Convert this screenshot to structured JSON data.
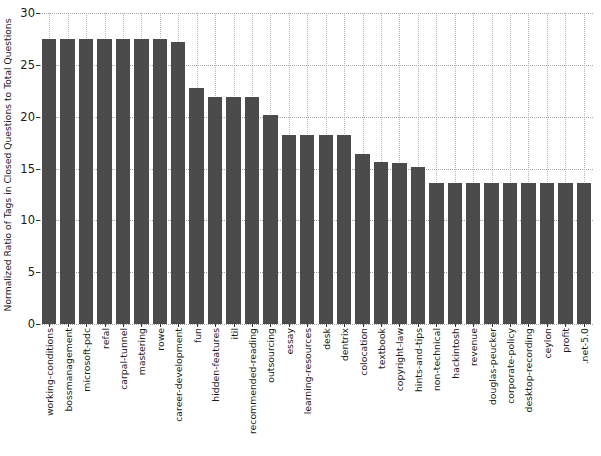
{
  "chart_data": {
    "type": "bar",
    "title": "",
    "xlabel": "",
    "ylabel": "Normalized Ratio of Tags in Closed Questions to Total Questions",
    "ylim": [
      0,
      30
    ],
    "yticks": [
      0,
      5,
      10,
      15,
      20,
      25,
      30
    ],
    "ytick_labels": [
      "0",
      "5",
      "10",
      "15",
      "20",
      "25",
      "30"
    ],
    "grid": true,
    "grid_style": "dotted",
    "legend": null,
    "bar_color": "#4b4b4b",
    "categories": [
      "working-conditions",
      "bossmanagement",
      "microsoft-pdc",
      "refal",
      "carpal-tunnel",
      "mastering",
      "rowe",
      "career-development",
      "fun",
      "hidden-features",
      "itil",
      "recommended-reading",
      "outsourcing",
      "essay",
      "learning-resources",
      "desk",
      "dentrix",
      "colocation",
      "textbook",
      "copyright-law",
      "hints-and-tips",
      "non-technical",
      "hackintosh",
      "revenue",
      "douglas-peucker",
      "corporate-policy",
      "desktop-recording",
      "ceylon",
      "profit",
      ".net-5.0"
    ],
    "values": [
      27.5,
      27.5,
      27.5,
      27.5,
      27.5,
      27.5,
      27.5,
      27.2,
      22.8,
      21.9,
      21.9,
      21.9,
      20.2,
      18.2,
      18.2,
      18.2,
      18.2,
      16.4,
      15.6,
      15.5,
      15.1,
      13.6,
      13.6,
      13.6,
      13.6,
      13.6,
      13.6,
      13.6,
      13.6,
      13.6
    ]
  }
}
